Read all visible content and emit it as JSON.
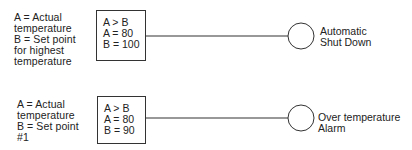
{
  "diagram": {
    "type": "comparator-to-output",
    "rows": [
      {
        "legend": [
          "A = Actual",
          "temperature",
          "B = Set point",
          "for highest",
          "temperature"
        ],
        "condition": [
          "A > B",
          "A = 80",
          "B = 100"
        ],
        "output": [
          "Automatic",
          "Shut Down"
        ]
      },
      {
        "legend": [
          "A = Actual",
          "temperature",
          "B = Set point",
          "#1"
        ],
        "condition": [
          "A > B",
          "A = 80",
          "B = 90"
        ],
        "output": [
          "Over temperature",
          "Alarm"
        ]
      }
    ],
    "line_color": "#333333",
    "text_color": "#222222"
  }
}
